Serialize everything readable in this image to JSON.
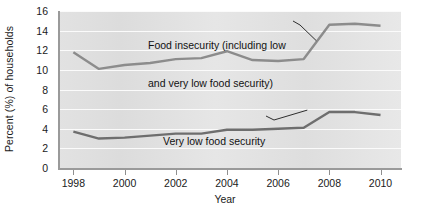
{
  "chart_data": {
    "type": "line",
    "title": "",
    "subtitle": "",
    "xlabel": "Year",
    "ylabel": "Percent (%) of households",
    "xlim": [
      1997.4,
      2010.8
    ],
    "ylim": [
      0,
      16
    ],
    "grid": true,
    "gridlines_y": [
      2,
      4,
      6,
      8,
      10,
      12,
      14,
      16
    ],
    "legend_position": "inline-annotations",
    "x": [
      1998,
      1999,
      2000,
      2001,
      2002,
      2003,
      2004,
      2005,
      2006,
      2007,
      2008,
      2009,
      2010
    ],
    "series": [
      {
        "name": "Food insecurity (including low and very low food security)",
        "values": [
          11.8,
          10.1,
          10.5,
          10.7,
          11.1,
          11.2,
          11.9,
          11.0,
          10.9,
          11.1,
          14.6,
          14.7,
          14.5
        ],
        "color": "#8c8c8c"
      },
      {
        "name": "Very low food security",
        "values": [
          3.7,
          3.0,
          3.1,
          3.3,
          3.5,
          3.5,
          3.9,
          3.9,
          4.0,
          4.1,
          5.7,
          5.7,
          5.4
        ],
        "color": "#6e6e6e"
      }
    ],
    "annotations": [
      {
        "id": "upper-series-label",
        "text_line_1": "Food insecurity (including low",
        "text_line_2": "and very low food security)",
        "target_year": 2008,
        "target_value": 14.6
      },
      {
        "id": "lower-series-label",
        "text_line_1": "Very low food security",
        "text_line_2": "",
        "target_year": 2008,
        "target_value": 5.7
      }
    ]
  },
  "axes": {
    "y_tick_labels": [
      "16",
      "14",
      "12",
      "10",
      "8",
      "6",
      "4",
      "2",
      "0"
    ],
    "y_tick_values": [
      16,
      14,
      12,
      10,
      8,
      6,
      4,
      2,
      0
    ],
    "x_tick_labels": [
      "1998",
      "2000",
      "2002",
      "2004",
      "2006",
      "2008",
      "2010"
    ],
    "x_tick_values": [
      1998,
      2000,
      2002,
      2004,
      2006,
      2008,
      2010
    ],
    "y_axis_title": "Percent (%) of households",
    "x_axis_title": "Year"
  },
  "style": {
    "plot_background": "#e2e2e2",
    "gridline_color": "#fbfbfb",
    "axis_color": "#9a9a9a",
    "upper_series_color": "#8c8c8c",
    "lower_series_color": "#6e6e6e",
    "text_color": "#1a1a1a",
    "page_background": "#ffffff"
  }
}
